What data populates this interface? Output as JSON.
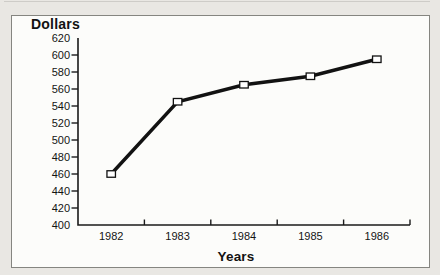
{
  "page": {
    "background": "#e9e7e3",
    "panel_background": "#fcfcfa",
    "panel_border_color": "#858580"
  },
  "chart_data": {
    "type": "line",
    "title": "",
    "xlabel": "Years",
    "ylabel": "Dollars",
    "categories": [
      "1982",
      "1983",
      "1984",
      "1985",
      "1986"
    ],
    "values": [
      460,
      545,
      565,
      575,
      595
    ],
    "ylim": [
      400,
      620
    ],
    "ytick_step": 20,
    "yticks": [
      400,
      420,
      440,
      460,
      480,
      500,
      520,
      540,
      560,
      580,
      600,
      620
    ],
    "grid": false,
    "legend": "none",
    "marker": "open-square",
    "line_color": "#121212",
    "axis_color": "#1a1a1a",
    "marker_fill": "#ffffff"
  }
}
